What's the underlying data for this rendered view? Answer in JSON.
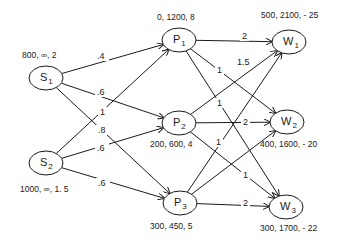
{
  "diagram": {
    "nodes": [
      {
        "id": "S1",
        "letter": "S",
        "sub": "1",
        "cx": 46,
        "cy": 78,
        "attrs": "800, ∞, 2",
        "ax": 22,
        "ay": 58
      },
      {
        "id": "S2",
        "letter": "S",
        "sub": "2",
        "cx": 46,
        "cy": 163,
        "attrs": "1000, ∞, 1. 5",
        "ax": 20,
        "ay": 192
      },
      {
        "id": "P1",
        "letter": "P",
        "sub": "1",
        "cx": 179,
        "cy": 40,
        "attrs": "0, 1200, 8",
        "ax": 157,
        "ay": 20
      },
      {
        "id": "P2",
        "letter": "P",
        "sub": "2",
        "cx": 179,
        "cy": 123,
        "attrs": "200, 600, 4",
        "ax": 150,
        "ay": 147
      },
      {
        "id": "P3",
        "letter": "P",
        "sub": "3",
        "cx": 180,
        "cy": 203,
        "attrs": "300, 450, 5",
        "ax": 150,
        "ay": 229
      },
      {
        "id": "W1",
        "letter": "W",
        "sub": "1",
        "cx": 289,
        "cy": 42,
        "attrs": "500, 2100, - 25",
        "ax": 261,
        "ay": 18
      },
      {
        "id": "W2",
        "letter": "W",
        "sub": "2",
        "cx": 287,
        "cy": 122,
        "attrs": "400, 1600, - 20",
        "ax": 260,
        "ay": 147
      },
      {
        "id": "W3",
        "letter": "W",
        "sub": "3",
        "cx": 286,
        "cy": 207,
        "attrs": "300, 1700, - 22",
        "ax": 260,
        "ay": 231
      }
    ],
    "edges": [
      {
        "from": "S1",
        "to": "P1",
        "label": ".4",
        "lx": 97,
        "ly": 59
      },
      {
        "from": "S1",
        "to": "P2",
        "label": ".6",
        "lx": 97,
        "ly": 95
      },
      {
        "from": "S1",
        "to": "P3",
        "label": ".8",
        "lx": 98,
        "ly": 133
      },
      {
        "from": "S2",
        "to": "P1",
        "label": "1",
        "lx": 100,
        "ly": 115
      },
      {
        "from": "S2",
        "to": "P2",
        "label": ".6",
        "lx": 97,
        "ly": 151
      },
      {
        "from": "S2",
        "to": "P3",
        "label": ".6",
        "lx": 98,
        "ly": 186
      },
      {
        "from": "P1",
        "to": "W1",
        "label": "2",
        "lx": 242,
        "ly": 39
      },
      {
        "from": "P1",
        "to": "W2",
        "label": "1",
        "lx": 217,
        "ly": 73
      },
      {
        "from": "P1",
        "to": "W3",
        "label": "1",
        "lx": 217,
        "ly": 106
      },
      {
        "from": "P2",
        "to": "W1",
        "label": "1.5",
        "lx": 237,
        "ly": 65
      },
      {
        "from": "P2",
        "to": "W2",
        "label": "2",
        "lx": 243,
        "ly": 125
      },
      {
        "from": "P2",
        "to": "W3",
        "label": "1",
        "lx": 243,
        "ly": 178
      },
      {
        "from": "P3",
        "to": "W1",
        "label": "1",
        "lx": 216,
        "ly": 145
      },
      {
        "from": "P3",
        "to": "W2",
        "label": "",
        "lx": 0,
        "ly": 0
      },
      {
        "from": "P3",
        "to": "W3",
        "label": "2",
        "lx": 243,
        "ly": 206
      }
    ],
    "node_rx": 17,
    "node_ry": 12,
    "stroke_color": "#1a1a1a",
    "background": "#ffffff"
  }
}
